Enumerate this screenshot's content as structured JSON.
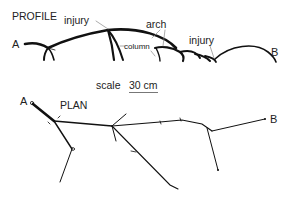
{
  "diagram": {
    "profile": {
      "title": "PROFILE",
      "end_a": "A",
      "end_b": "B",
      "labels": {
        "injury_1": "injury",
        "injury_2": "injury",
        "arch": "arch",
        "column": "column"
      }
    },
    "scale": {
      "label": "scale",
      "value": "30 cm"
    },
    "plan": {
      "title": "PLAN",
      "end_a": "A",
      "end_b": "B"
    },
    "colors": {
      "ink": "#111111",
      "leader": "#888888"
    }
  }
}
